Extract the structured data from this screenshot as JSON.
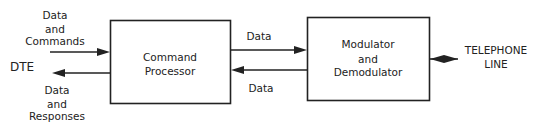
{
  "diagram": {
    "nodes": {
      "dte": {
        "label": "DTE"
      },
      "command_processor": {
        "lines": [
          "Command",
          "Processor"
        ]
      },
      "modem": {
        "lines": [
          "Modulator",
          "and",
          "Demodulator"
        ]
      },
      "telephone_line": {
        "lines": [
          "TELEPHONE",
          "LINE"
        ]
      }
    },
    "edges": {
      "dte_to_cp": {
        "lines": [
          "Data",
          "and",
          "Commands"
        ]
      },
      "cp_to_dte": {
        "lines": [
          "Data",
          "and",
          "Responses"
        ]
      },
      "cp_to_modem": {
        "label": "Data"
      },
      "modem_to_cp": {
        "label": "Data"
      },
      "modem_line": {
        "label": ""
      }
    }
  }
}
